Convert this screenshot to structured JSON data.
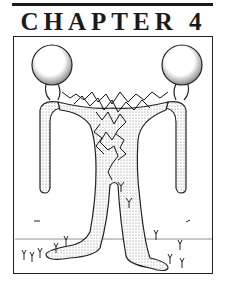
{
  "page": {
    "chapter_title": "CHAPTER 4"
  },
  "illustration": {
    "subject": "two-headed-figure-with-tangled-climbing-figures",
    "elements": [
      "left-head",
      "right-head",
      "tangled-crowd",
      "arms",
      "legs",
      "ground-line",
      "small-figures"
    ]
  }
}
